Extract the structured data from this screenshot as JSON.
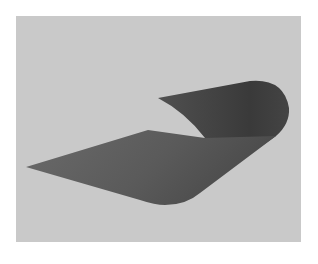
{
  "figure": {
    "colors": {
      "background_outer": "#ffffff",
      "panel": "#c9c9c9",
      "sheet_dark": "#3e3e3e",
      "sheet_mid": "#555555",
      "sheet_light": "#6a6a6a"
    }
  }
}
